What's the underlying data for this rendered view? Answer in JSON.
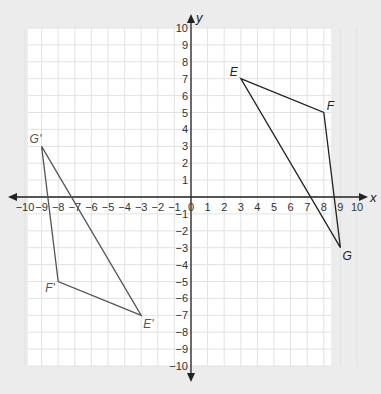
{
  "chart_data": {
    "type": "scatter",
    "title": "",
    "xlabel": "x",
    "ylabel": "y",
    "xlim": [
      -10,
      10
    ],
    "ylim": [
      -10,
      10
    ],
    "grid": true,
    "x_ticks": [
      -10,
      -9,
      -8,
      -7,
      -6,
      -5,
      -4,
      -3,
      -2,
      -1,
      0,
      1,
      2,
      3,
      4,
      5,
      6,
      7,
      8,
      9,
      10
    ],
    "y_ticks": [
      10,
      9,
      8,
      7,
      6,
      5,
      4,
      3,
      2,
      1,
      -1,
      -2,
      -3,
      -4,
      -5,
      -6,
      -7,
      -8,
      -9,
      -10
    ],
    "series": [
      {
        "name": "Triangle EFG",
        "color": "#222222",
        "points": [
          {
            "label": "E",
            "x": 3,
            "y": 7
          },
          {
            "label": "F",
            "x": 8,
            "y": 5
          },
          {
            "label": "G",
            "x": 9,
            "y": -3
          }
        ]
      },
      {
        "name": "Triangle E'F'G'",
        "color": "#555555",
        "points": [
          {
            "label": "E'",
            "x": -3,
            "y": -7
          },
          {
            "label": "F'",
            "x": -8,
            "y": -5
          },
          {
            "label": "G'",
            "x": -9,
            "y": 3
          }
        ]
      }
    ]
  },
  "colors": {
    "background": "#ececec",
    "panel": "#ffffff",
    "grid": "#e2e2e2",
    "axis": "#222222"
  }
}
